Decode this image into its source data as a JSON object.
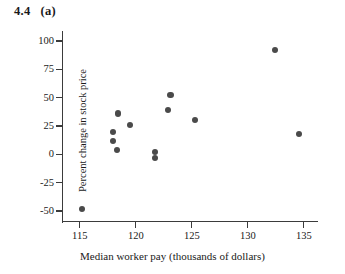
{
  "figure": {
    "number": "4.4",
    "part": "(a)"
  },
  "chart_data": {
    "type": "scatter",
    "title": "",
    "xlabel": "Median worker pay (thousands of dollars)",
    "ylabel": "Percent change in stock price",
    "xlim": [
      113.5,
      136.0
    ],
    "ylim": [
      -57,
      107
    ],
    "xticks": [
      115,
      120,
      125,
      130,
      135
    ],
    "xtick_labels": [
      "115",
      "120",
      "125",
      "130",
      "135"
    ],
    "yticks": [
      100,
      75,
      50,
      25,
      0,
      -25,
      -50
    ],
    "ytick_labels": [
      "100",
      "75",
      "50",
      "25",
      "0",
      "-25",
      "-50"
    ],
    "grid": false,
    "legend": false,
    "marker": "filled-circle",
    "marker_color": "#4a4a4a",
    "points": [
      {
        "x": 115.2,
        "y": -48
      },
      {
        "x": 118.4,
        "y": 36
      },
      {
        "x": 118.0,
        "y": 20
      },
      {
        "x": 118.0,
        "y": 12
      },
      {
        "x": 118.3,
        "y": 4
      },
      {
        "x": 119.5,
        "y": 26
      },
      {
        "x": 121.7,
        "y": 2
      },
      {
        "x": 121.7,
        "y": -3
      },
      {
        "x": 122.9,
        "y": 39
      },
      {
        "x": 123.1,
        "y": 52
      },
      {
        "x": 125.3,
        "y": 30
      },
      {
        "x": 132.4,
        "y": 92
      },
      {
        "x": 134.6,
        "y": 18
      }
    ]
  }
}
